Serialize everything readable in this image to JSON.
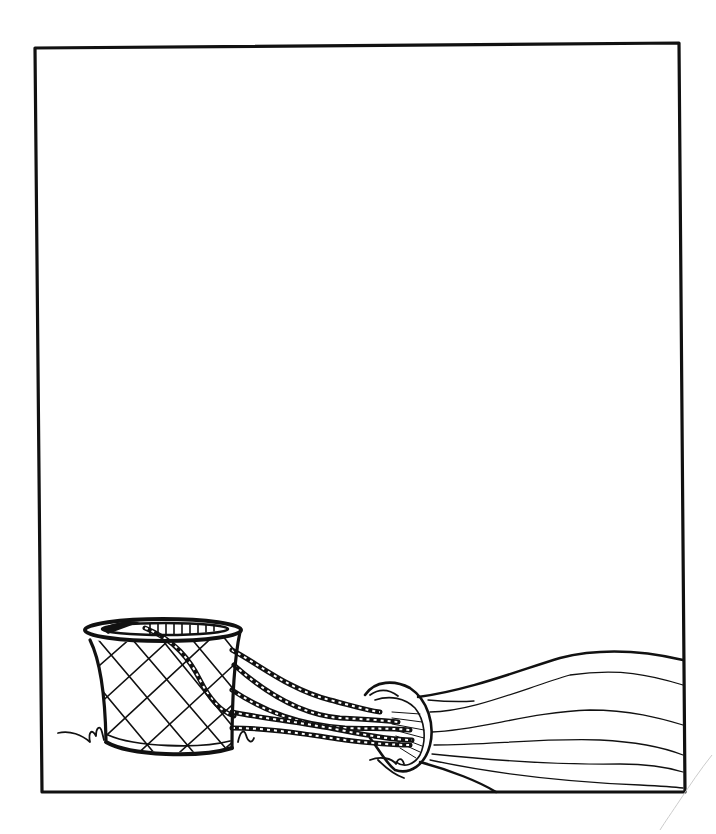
{
  "page": {
    "kind": "line-art illustration",
    "background_color": "#ffffff",
    "ink_color": "#111111"
  },
  "frame": {
    "top_left": [
      35,
      47
    ],
    "top_right": [
      679,
      43
    ],
    "bottom_right": [
      685,
      792
    ],
    "bottom_left": [
      42,
      792
    ]
  },
  "caption": {
    "text": ""
  },
  "illustration": {
    "elements": [
      {
        "name": "wicker-basket",
        "pattern": "diagonal cross-hatch"
      },
      {
        "name": "basket-ropes",
        "style": "twisted rope"
      },
      {
        "name": "balloon-mouth",
        "style": "oval ring"
      },
      {
        "name": "balloon-envelope",
        "style": "flowing gore lines",
        "gore_lines": 7
      },
      {
        "name": "grass-tufts",
        "count": 3
      }
    ]
  }
}
